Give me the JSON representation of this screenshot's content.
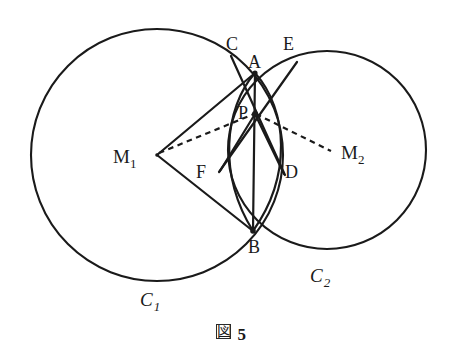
{
  "figure": {
    "caption_mark": "図",
    "caption_number": "5",
    "caption_full": "図 5"
  },
  "colors": {
    "stroke": "#1a1a1a",
    "background": "#ffffff",
    "label": "#1a1a1a"
  },
  "labels": {
    "C": "C",
    "A": "A",
    "E": "E",
    "P": "P",
    "F": "F",
    "D": "D",
    "B": "B",
    "M1_base": "M",
    "M1_sub": "1",
    "M2_base": "M",
    "M2_sub": "2",
    "C1_base": "C",
    "C1_sub": "1",
    "C2_base": "C",
    "C2_sub": "2"
  },
  "geometry": {
    "circles": [
      {
        "name": "C1",
        "cx": 157,
        "cy": 155,
        "r": 126
      },
      {
        "name": "C2",
        "cx": 327,
        "cy": 150,
        "r": 99
      }
    ],
    "points": {
      "A": {
        "x": 255,
        "y": 73
      },
      "B": {
        "x": 253,
        "y": 231
      },
      "P": {
        "x": 255,
        "y": 114
      },
      "C": {
        "x": 233,
        "y": 58
      },
      "D": {
        "x": 283,
        "y": 172
      },
      "E": {
        "x": 294,
        "y": 65
      },
      "F": {
        "x": 222,
        "y": 169
      },
      "M1": {
        "x": 157,
        "y": 155
      },
      "M2": {
        "x": 331,
        "y": 150
      }
    },
    "solid_segments": [
      {
        "from": "C",
        "to": "D"
      },
      {
        "from": "E",
        "to": "F"
      },
      {
        "from": "A",
        "to": "B"
      },
      {
        "from": "M1",
        "to": "A"
      },
      {
        "from": "M1",
        "to": "B"
      },
      {
        "from": "P",
        "to": "F"
      },
      {
        "from": "P",
        "to": "D"
      }
    ],
    "dashed_segments": [
      {
        "from": "M1",
        "to": "P"
      },
      {
        "from": "P",
        "to": "M2"
      }
    ],
    "arcs": [
      {
        "name": "arc-left-A-B",
        "from": "A",
        "to": "B",
        "bulge": "left"
      },
      {
        "name": "arc-right-A-B",
        "from": "A",
        "to": "B",
        "bulge": "right"
      }
    ]
  },
  "label_positions": {
    "C": {
      "x": 226,
      "y": 50
    },
    "A": {
      "x": 248,
      "y": 68
    },
    "E": {
      "x": 283,
      "y": 50
    },
    "P": {
      "x": 239,
      "y": 117
    },
    "F": {
      "x": 196,
      "y": 178
    },
    "D": {
      "x": 285,
      "y": 178
    },
    "B": {
      "x": 249,
      "y": 253
    },
    "M1": {
      "x": 113,
      "y": 162
    },
    "M2": {
      "x": 341,
      "y": 158
    },
    "C1": {
      "x": 140,
      "y": 305
    },
    "C2": {
      "x": 310,
      "y": 281
    }
  }
}
